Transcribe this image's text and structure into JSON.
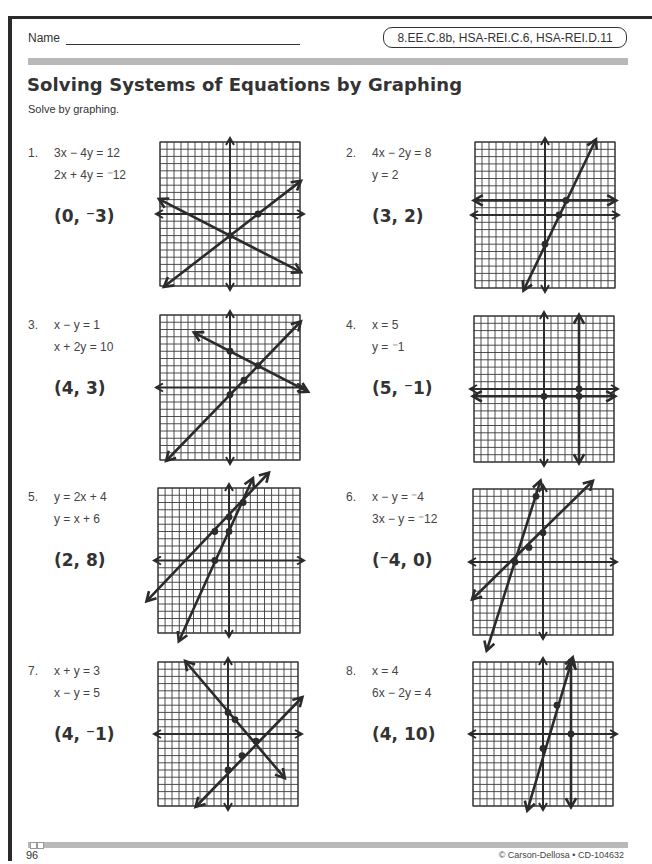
{
  "header": {
    "name_label": "Name",
    "standards": "8.EE.C.8b, HSA-REI.C.6, HSA-REI.D.11"
  },
  "title": "Solving Systems of Equations by Graphing",
  "instructions": "Solve by graphing.",
  "problems": [
    {
      "number": "1.",
      "eq1": "3x − 4y = 12",
      "eq2": "2x + 4y = ⁻12",
      "answer": "(0, ⁻3)",
      "graph": {
        "x": 160,
        "y": 142,
        "w": 140,
        "h": 144,
        "lines": [
          [
            -9.3,
            -10,
            10,
            4.5
          ],
          [
            -10,
            2,
            10,
            -8
          ]
        ],
        "points": [
          [
            0,
            -3
          ],
          [
            4,
            0
          ]
        ]
      }
    },
    {
      "number": "2.",
      "eq1": "4x − 2y = 8",
      "eq2": "y = 2",
      "answer": "(3, 2)",
      "graph": {
        "x": 475,
        "y": 142,
        "w": 140,
        "h": 146,
        "lines": [
          [
            -3,
            -10.2,
            7.2,
            10.2
          ],
          [
            -10,
            2,
            10,
            2
          ]
        ],
        "points": [
          [
            2,
            0
          ],
          [
            0,
            -4
          ],
          [
            3,
            2
          ]
        ]
      }
    },
    {
      "number": "3.",
      "eq1": "x − y = 1",
      "eq2": "x + 2y = 10",
      "answer": "(4, 3)",
      "graph": {
        "x": 160,
        "y": 315,
        "w": 140,
        "h": 145,
        "lines": [
          [
            -9,
            -10,
            10,
            9
          ],
          [
            -5,
            7.5,
            11,
            -0.5
          ]
        ],
        "points": [
          [
            0,
            -1
          ],
          [
            0,
            5
          ],
          [
            2,
            1
          ],
          [
            4,
            3
          ]
        ]
      }
    },
    {
      "number": "4.",
      "eq1": "x = 5",
      "eq2": "y = ⁻1",
      "answer": "(5, ⁻1)",
      "graph": {
        "x": 474,
        "y": 316,
        "w": 140,
        "h": 146,
        "lines": [
          [
            5,
            10,
            5,
            -10
          ],
          [
            -10,
            -1,
            10,
            -1
          ]
        ],
        "points": [
          [
            0,
            -1
          ],
          [
            5,
            -1
          ],
          [
            5,
            0
          ]
        ]
      }
    },
    {
      "number": "5.",
      "eq1": "y = 2x + 4",
      "eq2": "y = x + 6",
      "answer": "(2, 8)",
      "graph": {
        "x": 158,
        "y": 488,
        "w": 142,
        "h": 145,
        "lines": [
          [
            -7,
            -11,
            3.3,
            11.2
          ],
          [
            -11.5,
            -5.5,
            5.5,
            12
          ]
        ],
        "points": [
          [
            -2,
            0
          ],
          [
            0,
            4
          ],
          [
            0,
            6
          ],
          [
            -2,
            4
          ],
          [
            2,
            8
          ]
        ]
      }
    },
    {
      "number": "6.",
      "eq1": "x − y = ⁻4",
      "eq2": "3x − y = ⁻12",
      "answer": "(⁻4, 0)",
      "graph": {
        "x": 473,
        "y": 489,
        "w": 140,
        "h": 146,
        "lines": [
          [
            -10,
            -5,
            7,
            11
          ],
          [
            -8,
            -12,
            -0.4,
            11
          ]
        ],
        "points": [
          [
            -4,
            0
          ],
          [
            -2,
            2
          ],
          [
            0,
            4
          ],
          [
            -1,
            9
          ]
        ]
      }
    },
    {
      "number": "7.",
      "eq1": "x + y = 3",
      "eq2": "x − y = 5",
      "answer": "(4, ⁻1)",
      "graph": {
        "x": 158,
        "y": 662,
        "w": 140,
        "h": 144,
        "lines": [
          [
            -6,
            10,
            8,
            -6
          ],
          [
            -4.5,
            -10,
            10.5,
            5
          ]
        ],
        "points": [
          [
            0,
            3
          ],
          [
            1,
            2
          ],
          [
            4,
            -1
          ],
          [
            2,
            -3
          ],
          [
            0,
            -5
          ]
        ]
      }
    },
    {
      "number": "8.",
      "eq1": "x = 4",
      "eq2": "6x − 2y = 4",
      "answer": "(4, 10)",
      "graph": {
        "x": 473,
        "y": 662,
        "w": 140,
        "h": 144,
        "lines": [
          [
            4,
            10,
            4,
            -10
          ],
          [
            -2.2,
            -10.5,
            4.2,
            10.5
          ]
        ],
        "points": [
          [
            0,
            -2
          ],
          [
            2,
            4
          ],
          [
            4,
            0
          ],
          [
            4,
            10
          ]
        ]
      }
    }
  ],
  "footer": {
    "page_number": "96",
    "copyright": "© Carson-Dellosa • CD-104632"
  },
  "colors": {
    "ink": "#2b2b2b",
    "grid": "#3a3a3a",
    "band": "#b9b9b9"
  }
}
